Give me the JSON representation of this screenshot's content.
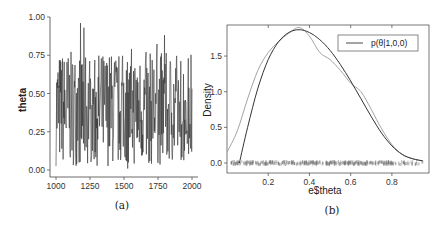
{
  "chart_data": [
    {
      "panel": "a",
      "caption": "(a)",
      "type": "line",
      "title": "",
      "xlabel": "",
      "ylabel": "theta",
      "xlim": [
        1000,
        2000
      ],
      "ylim": [
        0.0,
        1.0
      ],
      "xticks": [
        "1000",
        "1250",
        "1500",
        "1750",
        "2000"
      ],
      "yticks": [
        "0.00",
        "0.25",
        "0.50",
        "0.75",
        "1.00"
      ],
      "grid": false,
      "description": "MCMC trace of theta over iterations 1000-2000, fluctuating mostly between ~0.1 and ~0.85 around a mean near 0.4",
      "series": [
        {
          "name": "theta trace",
          "x_range": [
            1000,
            2000
          ],
          "mean": 0.4,
          "min": 0.0,
          "max": 0.96
        }
      ]
    },
    {
      "panel": "b",
      "caption": "(b)",
      "type": "line",
      "title": "",
      "xlabel": "e$theta",
      "ylabel": "Density",
      "xlim": [
        0.0,
        1.0
      ],
      "ylim": [
        -0.1,
        2.0
      ],
      "xticks": [
        "0.2",
        "0.4",
        "0.6",
        "0.8"
      ],
      "yticks": [
        "0.0",
        "0.5",
        "1.0",
        "1.5"
      ],
      "grid": false,
      "legend": {
        "position": "top-right",
        "entries": [
          "p(θ|1,0,0)"
        ]
      },
      "series": [
        {
          "name": "p(θ|1,0,0)",
          "x": [
            0.06,
            0.1,
            0.15,
            0.2,
            0.25,
            0.3,
            0.35,
            0.4,
            0.45,
            0.5,
            0.55,
            0.6,
            0.65,
            0.7,
            0.75,
            0.8,
            0.85,
            0.9,
            0.95
          ],
          "y": [
            0.0,
            0.5,
            1.05,
            1.45,
            1.7,
            1.83,
            1.87,
            1.83,
            1.73,
            1.58,
            1.38,
            1.15,
            0.9,
            0.65,
            0.42,
            0.24,
            0.12,
            0.06,
            0.03
          ]
        },
        {
          "name": "kernel density estimate",
          "x": [
            0.0,
            0.05,
            0.1,
            0.15,
            0.2,
            0.25,
            0.3,
            0.35,
            0.4,
            0.45,
            0.5,
            0.55,
            0.6,
            0.65,
            0.7,
            0.75,
            0.8,
            0.85,
            0.9,
            0.95
          ],
          "y": [
            0.15,
            0.45,
            0.9,
            1.3,
            1.55,
            1.7,
            1.82,
            1.9,
            1.78,
            1.55,
            1.45,
            1.3,
            1.12,
            1.0,
            0.75,
            0.48,
            0.26,
            0.12,
            0.06,
            0.03
          ]
        }
      ],
      "rug": "dense rug marks along y=0 from ~0.02 to ~0.95"
    }
  ]
}
